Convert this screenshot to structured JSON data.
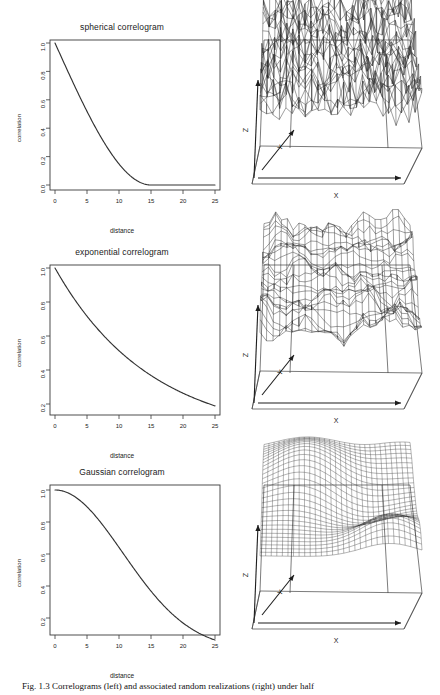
{
  "figure": {
    "caption": "Fig. 1.3   Correlograms (left) and associated random realizations (right) under half"
  },
  "chart_data": [
    {
      "type": "line",
      "title": "spherical correlogram",
      "xlabel": "distance",
      "ylabel": "correlation",
      "xlim": [
        0,
        25
      ],
      "ylim": [
        0.0,
        1.0
      ],
      "xticks": [
        0,
        5,
        10,
        15,
        20,
        25
      ],
      "yticks": [
        "1.0",
        "0.8",
        "0.6",
        "0.4",
        "0.2",
        "0.0"
      ],
      "grid": false,
      "legend": "none",
      "model": "spherical",
      "range": 15,
      "x": [
        0,
        1,
        2,
        3,
        4,
        5,
        6,
        7,
        8,
        9,
        10,
        11,
        12,
        13,
        14,
        15,
        16,
        18,
        20,
        22,
        25
      ],
      "y": [
        1.0,
        0.9,
        0.8,
        0.7,
        0.605,
        0.51,
        0.42,
        0.337,
        0.261,
        0.194,
        0.136,
        0.0884,
        0.0512,
        0.0246,
        0.00815,
        0.0,
        0.0,
        0.0,
        0.0,
        0.0,
        0.0
      ]
    },
    {
      "type": "line",
      "title": "exponential correlogram",
      "xlabel": "distance",
      "ylabel": "correlation",
      "xlim": [
        0,
        25
      ],
      "ylim": [
        0.17,
        1.0
      ],
      "xticks": [
        0,
        5,
        10,
        15,
        20,
        25
      ],
      "yticks": [
        "1.0",
        "0.8",
        "0.6",
        "0.4",
        "0.2"
      ],
      "grid": false,
      "legend": "none",
      "model": "exponential",
      "range": 15,
      "x": [
        0,
        2.5,
        5,
        7.5,
        10,
        12.5,
        15,
        17.5,
        20,
        22.5,
        25
      ],
      "y": [
        1.0,
        0.846,
        0.717,
        0.606,
        0.513,
        0.434,
        0.368,
        0.311,
        0.264,
        0.223,
        0.189
      ]
    },
    {
      "type": "line",
      "title": "Gaussian correlogram",
      "xlabel": "distance",
      "ylabel": "correlation",
      "xlim": [
        0,
        25
      ],
      "ylim": [
        0.05,
        1.0
      ],
      "xticks": [
        0,
        5,
        10,
        15,
        20,
        25
      ],
      "yticks": [
        "1.0",
        "0.8",
        "0.6",
        "0.4",
        "0.2"
      ],
      "grid": false,
      "legend": "none",
      "model": "gaussian",
      "range": 15,
      "x": [
        0,
        2.5,
        5,
        7.5,
        10,
        12.5,
        15,
        17.5,
        20,
        22.5,
        25
      ],
      "y": [
        1.0,
        0.972,
        0.895,
        0.779,
        0.641,
        0.5,
        0.368,
        0.258,
        0.171,
        0.107,
        0.063
      ]
    }
  ],
  "surfaces": [
    {
      "name": "spherical-random-field",
      "style": "rough-wireframe",
      "axis_x_label": "X",
      "axis_y_label": "Y",
      "axis_z_label": "Z",
      "smoothness": "very rough / noisy"
    },
    {
      "name": "exponential-random-field",
      "style": "rough-wireframe",
      "axis_x_label": "X",
      "axis_y_label": "Y",
      "axis_z_label": "Z",
      "smoothness": "rough / jagged"
    },
    {
      "name": "gaussian-random-field",
      "style": "smooth-mesh",
      "axis_x_label": "X",
      "axis_y_label": "Y",
      "axis_z_label": "Z",
      "smoothness": "very smooth"
    }
  ]
}
